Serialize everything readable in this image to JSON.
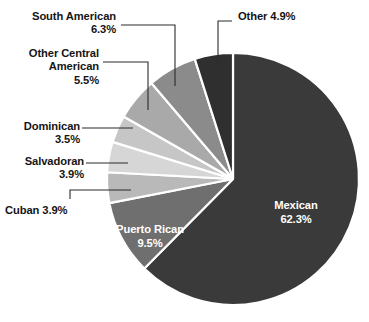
{
  "chart_data": {
    "type": "pie",
    "title": "",
    "subtitle": "",
    "xlabel": "",
    "ylabel": "",
    "legend_position": "none",
    "grid": false,
    "units": "percent",
    "total": 99.8,
    "categories": [
      "Mexican",
      "Puerto Rican",
      "Cuban",
      "Salvadoran",
      "Dominican",
      "Other Central American",
      "South American",
      "Other"
    ],
    "values": [
      62.3,
      9.5,
      3.9,
      3.9,
      3.5,
      5.5,
      6.3,
      4.9
    ],
    "colors": [
      "#3a3a3a",
      "#6f6f6f",
      "#b9b9b9",
      "#d6d6d6",
      "#c6c6c6",
      "#a9a9a9",
      "#8b8b8b",
      "#2f2f2f"
    ],
    "slices": [
      {
        "name": "Mexican",
        "value": 62.3,
        "label": "Mexican",
        "percent_text": "62.3%",
        "color": "#3a3a3a",
        "label_placement": "inside",
        "label_color": "#ffffff"
      },
      {
        "name": "Puerto Rican",
        "value": 9.5,
        "label": "Puerto Rican",
        "percent_text": "9.5%",
        "color": "#6f6f6f",
        "label_placement": "inside",
        "label_color": "#ffffff"
      },
      {
        "name": "Cuban",
        "value": 3.9,
        "label": "Cuban 3.9%",
        "percent_text": "3.9%",
        "color": "#b9b9b9",
        "label_placement": "callout",
        "label_color": "#151515"
      },
      {
        "name": "Salvadoran",
        "value": 3.9,
        "label": "Salvadoran\n3.9%",
        "percent_text": "3.9%",
        "color": "#d6d6d6",
        "label_placement": "callout",
        "label_color": "#151515"
      },
      {
        "name": "Dominican",
        "value": 3.5,
        "label": "Dominican\n3.5%",
        "percent_text": "3.5%",
        "color": "#c6c6c6",
        "label_placement": "callout",
        "label_color": "#151515"
      },
      {
        "name": "Other Central American",
        "value": 5.5,
        "label": "Other Central\nAmerican\n5.5%",
        "percent_text": "5.5%",
        "color": "#a9a9a9",
        "label_placement": "callout",
        "label_color": "#151515"
      },
      {
        "name": "South American",
        "value": 6.3,
        "label": "South American\n6.3%",
        "percent_text": "6.3%",
        "color": "#8b8b8b",
        "label_placement": "callout",
        "label_color": "#151515"
      },
      {
        "name": "Other",
        "value": 4.9,
        "label": "Other 4.9%",
        "percent_text": "4.9%",
        "color": "#2f2f2f",
        "label_placement": "callout",
        "label_color": "#151515"
      }
    ]
  },
  "labels": {
    "south_american": "South American\n6.3%",
    "other_central_american": "Other Central\nAmerican\n5.5%",
    "dominican": "Dominican\n3.5%",
    "salvadoran": "Salvadoran\n3.9%",
    "cuban": "Cuban 3.9%",
    "other": "Other 4.9%",
    "mexican_name": "Mexican",
    "mexican_pct": "62.3%",
    "puerto_rican_name": "Puerto Rican",
    "puerto_rican_pct": "9.5%"
  },
  "style": {
    "background": "#ffffff",
    "slice_separator": "#ffffff",
    "leader_line": "#2b2b2b",
    "text_color": "#151515",
    "inside_text_color": "#ffffff"
  }
}
